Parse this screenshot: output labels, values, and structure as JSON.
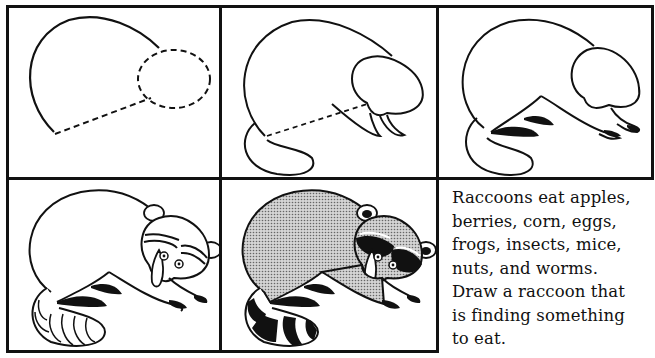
{
  "page": {
    "type": "how-to-draw worksheet",
    "subject": "raccoon"
  },
  "panels": [
    {
      "step": 1,
      "description": "Basic shapes: curved body outline with dashed ellipse for head and dashed belly line"
    },
    {
      "step": 2,
      "description": "Add head shape, tail, front legs; dashed belly line remains"
    },
    {
      "step": 3,
      "description": "Add hind legs, feet and black stripes under body"
    },
    {
      "step": 4,
      "description": "Add face mask, eyes, ears and striped tail outline"
    },
    {
      "step": 5,
      "description": "Finished raccoon shaded with dotted gray fill and black mask and tail rings"
    }
  ],
  "caption": {
    "lines": [
      "Raccoons eat apples,",
      "berries, corn, eggs,",
      "frogs, insects, mice,",
      "nuts, and worms.",
      "Draw a raccoon that",
      "is finding something",
      "to eat."
    ]
  },
  "colors": {
    "ink": "#111111",
    "paper": "#ffffff",
    "shade": "#b8b8b8"
  }
}
